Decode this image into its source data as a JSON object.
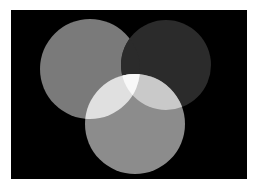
{
  "figure": {
    "width": 255,
    "height": 189,
    "page_background": "#ffffff",
    "panel": {
      "x": 11,
      "y": 10,
      "width": 236,
      "height": 169,
      "background_color": "#000000",
      "background_name": "black"
    }
  },
  "chart_data": {
    "type": "venn",
    "subtitle": "",
    "xlabel": "",
    "ylabel": "",
    "grid": false,
    "legend_position": "none",
    "set_count": 3,
    "background": "#000000",
    "sets": [
      {
        "name": "left-circle",
        "label": "",
        "channel": "red",
        "cx": 90,
        "cy": 69,
        "r": 50,
        "color": "#7a7a7a",
        "gray_value": 122,
        "z_order": 1
      },
      {
        "name": "top-right-circle",
        "label": "",
        "channel": "blue",
        "cx": 166,
        "cy": 65,
        "r": 45,
        "color": "#2b2b2b",
        "gray_value": 43,
        "z_order": 2
      },
      {
        "name": "bottom-circle",
        "label": "",
        "channel": "green",
        "cx": 135,
        "cy": 124,
        "r": 50,
        "color": "#8c8c8c",
        "gray_value": 140,
        "z_order": 3
      }
    ],
    "intersections": [
      {
        "name": "left-and-top-right",
        "label": "",
        "mix": "magenta",
        "color": "#2b2b2b",
        "gray_value": 43
      },
      {
        "name": "left-and-bottom",
        "label": "",
        "mix": "yellow",
        "color": "#e0e0e0",
        "gray_value": 224
      },
      {
        "name": "top-right-and-bottom",
        "label": "",
        "mix": "cyan",
        "color": "#c9c9c9",
        "gray_value": 201
      },
      {
        "name": "all-three",
        "label": "",
        "mix": "white",
        "color": "#f8f8f8",
        "gray_value": 248
      }
    ]
  }
}
